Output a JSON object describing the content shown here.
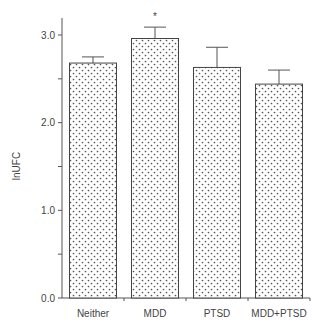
{
  "chart_data": {
    "type": "bar",
    "title": "",
    "xlabel": "",
    "ylabel": "lnUFC",
    "categories": [
      "Neither",
      "MDD",
      "PTSD",
      "MDD+PTSD"
    ],
    "values": [
      2.68,
      2.96,
      2.63,
      2.44
    ],
    "error": [
      0.07,
      0.13,
      0.23,
      0.16
    ],
    "annotations": [
      {
        "category": "MDD",
        "text": "*"
      }
    ],
    "ylim": [
      0,
      3.2
    ],
    "yticks": [
      {
        "value": 0.0,
        "label": "0.0"
      },
      {
        "value": 0.5,
        "label": ""
      },
      {
        "value": 1.0,
        "label": "1.0"
      },
      {
        "value": 1.5,
        "label": ""
      },
      {
        "value": 2.0,
        "label": "2.0"
      },
      {
        "value": 2.5,
        "label": ""
      },
      {
        "value": 3.0,
        "label": "3.0"
      }
    ],
    "grid": false,
    "legend": null,
    "bar_fill": "dotted",
    "colors": {
      "axis": "#555555",
      "bar_edge": "#444444",
      "dot": "#555555",
      "background": "#ffffff"
    }
  }
}
